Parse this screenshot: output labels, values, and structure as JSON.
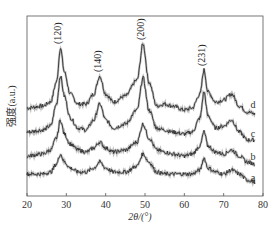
{
  "chart_data": {
    "type": "line",
    "title": "",
    "xlabel": "2θ/(°)",
    "ylabel": "强度(a.u.)",
    "xlim": [
      20,
      80
    ],
    "xticks": [
      20,
      30,
      40,
      50,
      60,
      70,
      80
    ],
    "yticks": [],
    "grid": false,
    "legend": "inline labels at right end of each curve",
    "peak_annotations": [
      {
        "label": "(120)",
        "x": 28.5
      },
      {
        "label": "(140)",
        "x": 38.5
      },
      {
        "label": "(200)",
        "x": 49.5
      },
      {
        "label": "(231)",
        "x": 65.0
      }
    ],
    "x": [
      20,
      24,
      26,
      27.5,
      28.5,
      29.5,
      31,
      33,
      35,
      37,
      38.5,
      40,
      42,
      45,
      48,
      49.5,
      51,
      53,
      55,
      57,
      60,
      62,
      64,
      65,
      66,
      68,
      70,
      72,
      74,
      76,
      78
    ],
    "series": [
      {
        "name": "d",
        "values": [
          82,
          84,
          88,
          108,
          142,
          118,
          96,
          86,
          86,
          96,
          114,
          96,
          88,
          94,
          110,
          146,
          108,
          84,
          86,
          84,
          80,
          82,
          96,
          120,
          98,
          88,
          90,
          96,
          84,
          78,
          76
        ]
      },
      {
        "name": "c",
        "values": [
          58,
          60,
          64,
          86,
          114,
          94,
          72,
          62,
          60,
          70,
          86,
          70,
          62,
          66,
          80,
          112,
          80,
          62,
          60,
          58,
          56,
          58,
          72,
          98,
          74,
          62,
          64,
          70,
          58,
          50,
          50
        ]
      },
      {
        "name": "b",
        "values": [
          34,
          36,
          40,
          52,
          70,
          56,
          46,
          40,
          38,
          42,
          48,
          42,
          38,
          40,
          48,
          66,
          52,
          40,
          38,
          36,
          34,
          36,
          44,
          58,
          44,
          38,
          36,
          40,
          34,
          28,
          26
        ]
      },
      {
        "name": "a",
        "values": [
          16,
          16,
          18,
          26,
          36,
          28,
          22,
          18,
          18,
          22,
          28,
          22,
          18,
          18,
          24,
          36,
          28,
          18,
          16,
          16,
          16,
          16,
          20,
          32,
          22,
          18,
          16,
          20,
          16,
          10,
          8
        ]
      }
    ]
  }
}
